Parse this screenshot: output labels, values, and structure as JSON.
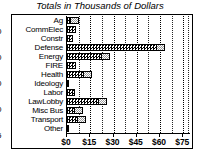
{
  "chart_data": {
    "type": "bar",
    "orientation": "horizontal",
    "title": "Totals in Thousands of Dollars",
    "xlabel": "",
    "ylabel": "",
    "categories": [
      "Ag",
      "CommElec",
      "Constr",
      "Defense",
      "Energy",
      "FIRE",
      "Health",
      "Ideology",
      "Labor",
      "LawLobby",
      "Misc Bus",
      "Transport",
      "Other"
    ],
    "values": [
      8,
      6,
      4,
      63,
      28,
      6,
      16,
      1,
      5,
      26,
      10,
      12,
      1
    ],
    "xlim": [
      0,
      80
    ],
    "xticks": [
      0,
      15,
      30,
      45,
      60,
      75
    ],
    "xtick_labels": [
      "$0",
      "$15",
      "$30",
      "$45",
      "$60",
      "$75"
    ],
    "grid": true,
    "grid_axis": "x",
    "legend": null,
    "series_name": "Totals"
  },
  "style": {
    "bar_fill": "#000000",
    "bar_cap_fill": "#9a9a9a",
    "border": "#000000",
    "background": "#ffffff"
  },
  "edge_digits": [
    "0",
    "0",
    "0",
    "0",
    "5"
  ]
}
